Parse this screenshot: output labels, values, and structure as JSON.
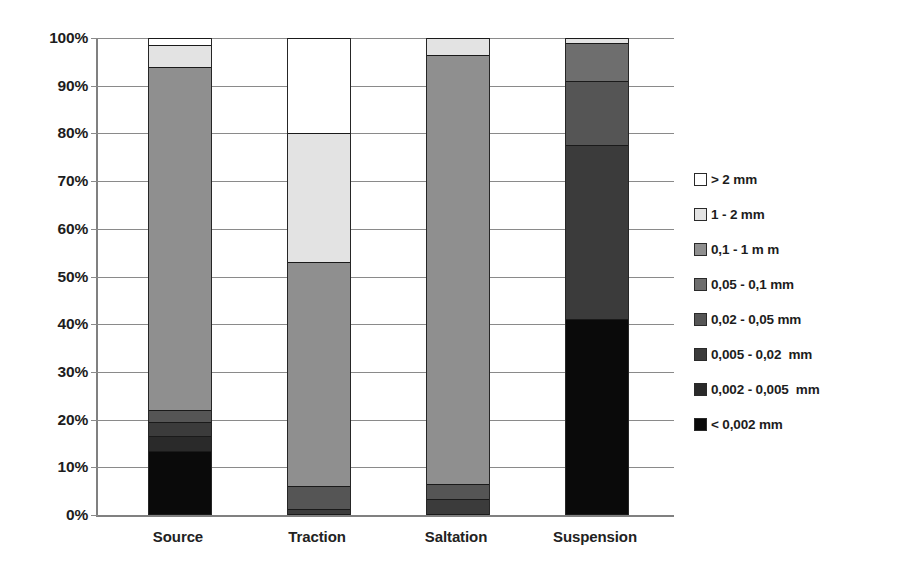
{
  "chart_data": {
    "type": "bar",
    "subtype": "stacked-bar-100-percent",
    "title": "",
    "xlabel": "",
    "ylabel": "",
    "ylim": [
      0,
      100
    ],
    "ytick_labels": [
      "0%",
      "10%",
      "20%",
      "30%",
      "40%",
      "50%",
      "60%",
      "70%",
      "80%",
      "90%",
      "100%"
    ],
    "ytick_values": [
      0,
      10,
      20,
      30,
      40,
      50,
      60,
      70,
      80,
      90,
      100
    ],
    "grid": true,
    "legend_position": "right",
    "categories": [
      "Source",
      "Traction",
      "Saltation",
      "Suspension"
    ],
    "series": [
      {
        "name": "> 2 mm",
        "color": "#ffffff",
        "values": [
          1.5,
          20.0,
          0.0,
          0.0
        ]
      },
      {
        "name": "1 - 2 mm",
        "color": "#e3e3e3",
        "values": [
          4.5,
          27.0,
          3.5,
          1.0
        ]
      },
      {
        "name": "0,1 - 1 m m",
        "color": "#8f8f8f",
        "values": [
          72.0,
          47.0,
          90.0,
          0.0
        ]
      },
      {
        "name": "0,05 - 0,1 mm",
        "color": "#6e6e6e",
        "values": [
          0.0,
          0.0,
          0.0,
          8.0
        ]
      },
      {
        "name": "0,02 - 0,05 mm",
        "color": "#555555",
        "values": [
          2.5,
          4.8,
          3.2,
          13.5
        ]
      },
      {
        "name": "0,005 - 0,02  mm",
        "color": "#3b3b3b",
        "values": [
          3.0,
          1.2,
          3.3,
          36.5
        ]
      },
      {
        "name": "0,002 - 0,005  mm",
        "color": "#2a2a2a",
        "values": [
          3.0,
          0.0,
          0.0,
          0.0
        ]
      },
      {
        "name": "< 0,002 mm",
        "color": "#0a0a0a",
        "values": [
          13.5,
          0.0,
          0.0,
          41.0
        ]
      }
    ]
  },
  "legend": {
    "items": [
      {
        "label": "> 2 mm",
        "color": "#ffffff"
      },
      {
        "label": "1 - 2 mm",
        "color": "#e3e3e3"
      },
      {
        "label": "0,1 - 1 m m",
        "color": "#8f8f8f"
      },
      {
        "label": "0,05 - 0,1 mm",
        "color": "#6e6e6e"
      },
      {
        "label": "0,02 - 0,05 mm",
        "color": "#555555"
      },
      {
        "label": "0,005 - 0,02  mm",
        "color": "#3b3b3b"
      },
      {
        "label": "0,002 - 0,005  mm",
        "color": "#2a2a2a"
      },
      {
        "label": "< 0,002 mm",
        "color": "#0a0a0a"
      }
    ]
  }
}
